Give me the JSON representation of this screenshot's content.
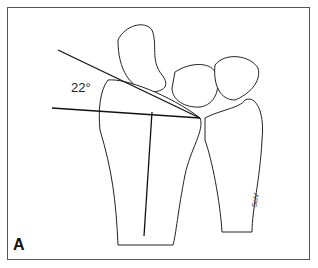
{
  "figure": {
    "panel_label": "A",
    "angle_label": "22°",
    "signature": "Sch/",
    "colors": {
      "line": "#1a1a1a",
      "border": "#555555",
      "background": "#ffffff"
    }
  }
}
